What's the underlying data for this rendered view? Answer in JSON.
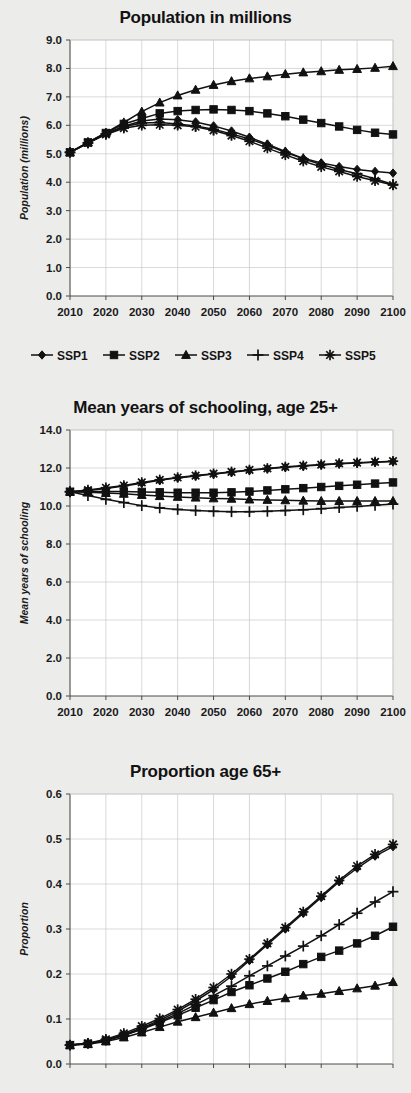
{
  "figure": {
    "background_color": "#ececeb",
    "plot_background_color": "#ffffff",
    "series_color": "#111111",
    "grid_color": "#c9c9c9"
  },
  "legend": {
    "position": "below-first-chart",
    "entries": [
      {
        "label": "SSP1",
        "marker": "diamond"
      },
      {
        "label": "SSP2",
        "marker": "square"
      },
      {
        "label": "SSP3",
        "marker": "triangle"
      },
      {
        "label": "SSP4",
        "marker": "plus"
      },
      {
        "label": "SSP5",
        "marker": "asterisk"
      }
    ]
  },
  "chart_data": [
    {
      "type": "line",
      "title": "Population in millions",
      "xlabel": "",
      "ylabel": "Population (millions)",
      "x": [
        2010,
        2015,
        2020,
        2025,
        2030,
        2035,
        2040,
        2045,
        2050,
        2055,
        2060,
        2065,
        2070,
        2075,
        2080,
        2085,
        2090,
        2095,
        2100
      ],
      "xticks": [
        2010,
        2020,
        2030,
        2040,
        2050,
        2060,
        2070,
        2080,
        2090,
        2100
      ],
      "xlim": [
        2010,
        2100
      ],
      "ylim": [
        0.0,
        9.0
      ],
      "yticks": [
        0.0,
        1.0,
        2.0,
        3.0,
        4.0,
        5.0,
        6.0,
        7.0,
        8.0,
        9.0
      ],
      "ytick_labels": [
        "0.0",
        "1.0",
        "2.0",
        "3.0",
        "4.0",
        "5.0",
        "6.0",
        "7.0",
        "8.0",
        "9.0"
      ],
      "grid": true,
      "legend_position": "bottom",
      "series": [
        {
          "name": "SSP1",
          "marker": "diamond",
          "values": [
            5.05,
            5.38,
            5.7,
            5.97,
            6.15,
            6.22,
            6.2,
            6.12,
            5.98,
            5.8,
            5.58,
            5.34,
            5.08,
            4.84,
            4.68,
            4.55,
            4.45,
            4.38,
            4.32
          ]
        },
        {
          "name": "SSP2",
          "marker": "square",
          "values": [
            5.05,
            5.4,
            5.73,
            6.05,
            6.24,
            6.42,
            6.5,
            6.54,
            6.56,
            6.54,
            6.5,
            6.42,
            6.32,
            6.2,
            6.08,
            5.96,
            5.84,
            5.74,
            5.68
          ]
        },
        {
          "name": "SSP3",
          "marker": "triangle",
          "values": [
            5.05,
            5.4,
            5.74,
            6.1,
            6.48,
            6.8,
            7.05,
            7.25,
            7.42,
            7.55,
            7.65,
            7.72,
            7.8,
            7.86,
            7.9,
            7.95,
            7.98,
            8.02,
            8.08
          ]
        },
        {
          "name": "SSP4",
          "marker": "plus",
          "values": [
            5.05,
            5.38,
            5.7,
            5.95,
            6.08,
            6.1,
            6.05,
            5.98,
            5.86,
            5.7,
            5.52,
            5.3,
            5.05,
            4.82,
            4.62,
            4.45,
            4.3,
            4.12,
            3.92
          ]
        },
        {
          "name": "SSP5",
          "marker": "asterisk",
          "values": [
            5.05,
            5.38,
            5.68,
            5.9,
            6.0,
            6.02,
            6.0,
            5.95,
            5.82,
            5.64,
            5.44,
            5.2,
            4.96,
            4.74,
            4.54,
            4.38,
            4.2,
            4.05,
            3.9
          ]
        }
      ]
    },
    {
      "type": "line",
      "title": "Mean years of schooling, age 25+",
      "xlabel": "",
      "ylabel": "Mean years of schooling",
      "x": [
        2010,
        2015,
        2020,
        2025,
        2030,
        2035,
        2040,
        2045,
        2050,
        2055,
        2060,
        2065,
        2070,
        2075,
        2080,
        2085,
        2090,
        2095,
        2100
      ],
      "xticks": [
        2010,
        2020,
        2030,
        2040,
        2050,
        2060,
        2070,
        2080,
        2090,
        2100
      ],
      "xlim": [
        2010,
        2100
      ],
      "ylim": [
        0.0,
        14.0
      ],
      "yticks": [
        0.0,
        2.0,
        4.0,
        6.0,
        8.0,
        10.0,
        12.0,
        14.0
      ],
      "ytick_labels": [
        "0.0",
        "2.0",
        "4.0",
        "6.0",
        "8.0",
        "10.0",
        "12.0",
        "14.0"
      ],
      "grid": true,
      "legend_position": "none",
      "series": [
        {
          "name": "SSP1",
          "marker": "diamond",
          "values": [
            10.75,
            10.82,
            10.92,
            11.05,
            11.2,
            11.35,
            11.48,
            11.58,
            11.68,
            11.78,
            11.88,
            11.96,
            12.04,
            12.1,
            12.16,
            12.22,
            12.26,
            12.3,
            12.34
          ]
        },
        {
          "name": "SSP2",
          "marker": "square",
          "values": [
            10.75,
            10.76,
            10.76,
            10.76,
            10.74,
            10.72,
            10.7,
            10.7,
            10.7,
            10.72,
            10.76,
            10.82,
            10.88,
            10.94,
            11.0,
            11.06,
            11.12,
            11.18,
            11.24
          ]
        },
        {
          "name": "SSP3",
          "marker": "triangle",
          "values": [
            10.75,
            10.72,
            10.68,
            10.64,
            10.58,
            10.52,
            10.48,
            10.44,
            10.4,
            10.38,
            10.34,
            10.32,
            10.3,
            10.28,
            10.26,
            10.26,
            10.26,
            10.26,
            10.26
          ]
        },
        {
          "name": "SSP4",
          "marker": "plus",
          "values": [
            10.75,
            10.55,
            10.35,
            10.18,
            10.02,
            9.9,
            9.82,
            9.76,
            9.72,
            9.7,
            9.7,
            9.72,
            9.76,
            9.8,
            9.86,
            9.92,
            9.98,
            10.04,
            10.1
          ]
        },
        {
          "name": "SSP5",
          "marker": "asterisk",
          "values": [
            10.75,
            10.84,
            10.96,
            11.08,
            11.24,
            11.38,
            11.5,
            11.6,
            11.7,
            11.8,
            11.9,
            11.98,
            12.06,
            12.12,
            12.18,
            12.24,
            12.28,
            12.32,
            12.36
          ]
        }
      ]
    },
    {
      "type": "line",
      "title": "Proportion age 65+",
      "xlabel": "",
      "ylabel": "Proportion",
      "x": [
        2010,
        2015,
        2020,
        2025,
        2030,
        2035,
        2040,
        2045,
        2050,
        2055,
        2060,
        2065,
        2070,
        2075,
        2080,
        2085,
        2090,
        2095,
        2100
      ],
      "xticks": [
        2010,
        2020,
        2030,
        2040,
        2050,
        2060,
        2070,
        2080,
        2090,
        2100
      ],
      "xlim": [
        2010,
        2100
      ],
      "ylim": [
        0.0,
        0.6
      ],
      "yticks": [
        0.0,
        0.1,
        0.2,
        0.3,
        0.4,
        0.5,
        0.6
      ],
      "ytick_labels": [
        "0.0",
        "0.1",
        "0.2",
        "0.3",
        "0.4",
        "0.5",
        "0.6"
      ],
      "grid": true,
      "legend_position": "none",
      "axis_labels_cropped": true,
      "series": [
        {
          "name": "SSP1",
          "marker": "diamond",
          "values": [
            0.042,
            0.045,
            0.053,
            0.065,
            0.08,
            0.097,
            0.117,
            0.14,
            0.165,
            0.195,
            0.23,
            0.265,
            0.3,
            0.335,
            0.37,
            0.405,
            0.435,
            0.462,
            0.483
          ]
        },
        {
          "name": "SSP2",
          "marker": "square",
          "values": [
            0.042,
            0.045,
            0.052,
            0.063,
            0.077,
            0.092,
            0.108,
            0.125,
            0.142,
            0.16,
            0.175,
            0.19,
            0.205,
            0.222,
            0.238,
            0.252,
            0.268,
            0.285,
            0.305
          ]
        },
        {
          "name": "SSP3",
          "marker": "triangle",
          "values": [
            0.042,
            0.044,
            0.05,
            0.059,
            0.07,
            0.082,
            0.094,
            0.104,
            0.114,
            0.124,
            0.133,
            0.14,
            0.146,
            0.152,
            0.156,
            0.162,
            0.168,
            0.174,
            0.182
          ]
        },
        {
          "name": "SSP4",
          "marker": "plus",
          "values": [
            0.042,
            0.046,
            0.053,
            0.064,
            0.078,
            0.094,
            0.112,
            0.132,
            0.152,
            0.173,
            0.196,
            0.218,
            0.24,
            0.262,
            0.285,
            0.31,
            0.335,
            0.36,
            0.383
          ]
        },
        {
          "name": "SSP5",
          "marker": "asterisk",
          "values": [
            0.042,
            0.046,
            0.055,
            0.068,
            0.084,
            0.101,
            0.121,
            0.144,
            0.17,
            0.2,
            0.233,
            0.268,
            0.303,
            0.338,
            0.373,
            0.408,
            0.44,
            0.466,
            0.488
          ]
        }
      ]
    }
  ]
}
